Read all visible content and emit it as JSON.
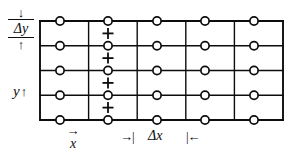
{
  "figure": {
    "stroke_color": "#0d0d0d",
    "background_color": "#ffffff",
    "node_fill": "#ffffff"
  },
  "labels": {
    "delta_y": "Δy",
    "delta_y_arrow_down": "↓",
    "delta_y_arrow_up": "↑",
    "y_axis": "y",
    "y_axis_arrow": "↑",
    "x_axis": "x",
    "x_axis_arrow": "→",
    "delta_x": "Δx",
    "delta_x_tick_left": "→|",
    "delta_x_tick_right": "|←"
  },
  "chart_data": {
    "type": "scatter",
    "xlabel": "x",
    "ylabel": "y",
    "grid": true,
    "xlim": [
      40,
      283
    ],
    "ylim": [
      21,
      120
    ],
    "grid_lines": {
      "vertical_x": [
        40,
        88.6,
        137.2,
        185.8,
        234.4,
        283
      ],
      "horizontal_y": [
        21,
        45.75,
        70.5,
        95.25,
        120
      ]
    },
    "spacing": {
      "delta_x": 48.6,
      "delta_y": 24.75
    },
    "series": [
      {
        "name": "node-circles",
        "marker": "circle",
        "points": [
          {
            "x": 60,
            "y": 21
          },
          {
            "x": 108,
            "y": 21
          },
          {
            "x": 157,
            "y": 21
          },
          {
            "x": 205,
            "y": 21
          },
          {
            "x": 254,
            "y": 21
          },
          {
            "x": 60,
            "y": 45.75
          },
          {
            "x": 108,
            "y": 45.75
          },
          {
            "x": 157,
            "y": 45.75
          },
          {
            "x": 205,
            "y": 45.75
          },
          {
            "x": 254,
            "y": 45.75
          },
          {
            "x": 60,
            "y": 70.5
          },
          {
            "x": 108,
            "y": 70.5
          },
          {
            "x": 157,
            "y": 70.5
          },
          {
            "x": 205,
            "y": 70.5
          },
          {
            "x": 254,
            "y": 70.5
          },
          {
            "x": 60,
            "y": 95.25
          },
          {
            "x": 108,
            "y": 95.25
          },
          {
            "x": 157,
            "y": 95.25
          },
          {
            "x": 205,
            "y": 95.25
          },
          {
            "x": 254,
            "y": 95.25
          },
          {
            "x": 60,
            "y": 120
          },
          {
            "x": 108,
            "y": 120
          },
          {
            "x": 157,
            "y": 120
          },
          {
            "x": 205,
            "y": 120
          },
          {
            "x": 254,
            "y": 120
          }
        ]
      },
      {
        "name": "plus-markers",
        "marker": "plus",
        "points": [
          {
            "x": 108,
            "y": 33.4
          },
          {
            "x": 108,
            "y": 58.1
          },
          {
            "x": 108,
            "y": 82.9
          },
          {
            "x": 108,
            "y": 107.6
          }
        ]
      }
    ],
    "annotations": [
      {
        "text": "Δy",
        "position": "left",
        "span": [
          21,
          45.75
        ]
      },
      {
        "text": "Δx",
        "position": "bottom",
        "span": [
          137.2,
          185.8
        ]
      },
      {
        "text": "y",
        "position": "left-axis"
      },
      {
        "text": "x",
        "position": "bottom-axis"
      }
    ]
  }
}
